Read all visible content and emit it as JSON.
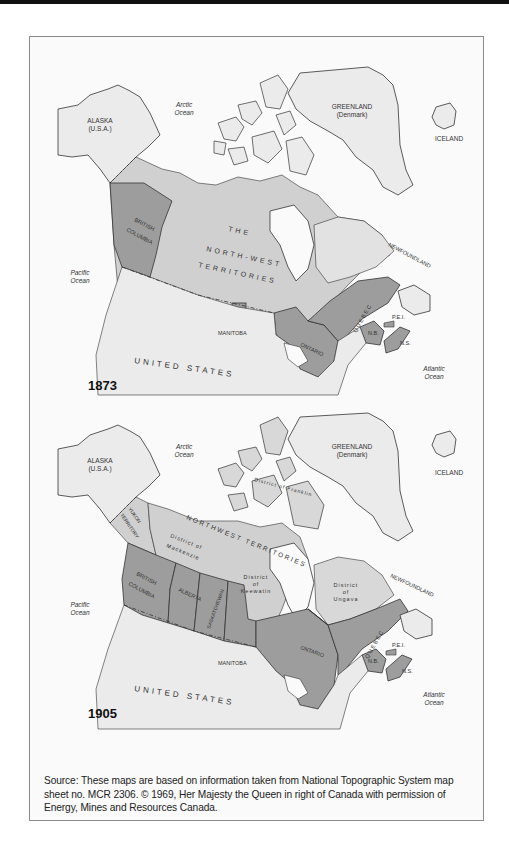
{
  "colors": {
    "land_light": "#ebebeb",
    "territory": "#cfcfcf",
    "province": "#9d9d9d",
    "ocean": "#fafafa",
    "outline": "#333333",
    "label": "#333333"
  },
  "maps": [
    {
      "year": "1873",
      "labels": {
        "alaska": "ALASKA",
        "alaska_sub": "(U.S.A.)",
        "arctic": "Arctic",
        "arctic2": "Ocean",
        "greenland": "GREENLAND",
        "greenland_sub": "(Denmark)",
        "iceland": "ICELAND",
        "pacific": "Pacific",
        "pacific2": "Ocean",
        "atlantic": "Atlantic",
        "atlantic2": "Ocean",
        "bc1": "BRITISH",
        "bc2": "COLUMBIA",
        "nwt1": "THE",
        "nwt2": "NORTH-WEST",
        "nwt3": "TERRITORIES",
        "manitoba": "MANITOBA",
        "ontario": "ONTARIO",
        "quebec": "QUEBEC",
        "newfoundland": "NEWFOUNDLAND",
        "pei": "P.E.I.",
        "nb": "N.B.",
        "ns": "N.S.",
        "us": "UNITED STATES"
      }
    },
    {
      "year": "1905",
      "labels": {
        "alaska": "ALASKA",
        "alaska_sub": "(U.S.A.)",
        "arctic": "Arctic",
        "arctic2": "Ocean",
        "greenland": "GREENLAND",
        "greenland_sub": "(Denmark)",
        "iceland": "ICELAND",
        "pacific": "Pacific",
        "pacific2": "Ocean",
        "atlantic": "Atlantic",
        "atlantic2": "Ocean",
        "yukon1": "YUKON",
        "yukon2": "TERRITORY",
        "bc1": "BRITISH",
        "bc2": "COLUMBIA",
        "alberta": "ALBERTA",
        "saskatchewan": "SASKATCHEWAN",
        "nwt": "NORTHWEST TERRITORIES",
        "franklin": "District of Franklin",
        "mackenzie1": "District of",
        "mackenzie2": "Mackenzie",
        "keewatin1": "District",
        "keewatin2": "of",
        "keewatin3": "Keewatin",
        "ungava1": "District",
        "ungava2": "of",
        "ungava3": "Ungava",
        "manitoba": "MANITOBA",
        "ontario": "ONTARIO",
        "quebec": "QUEBEC",
        "newfoundland": "NEWFOUNDLAND",
        "pei": "P.E.I.",
        "nb": "N.B.",
        "ns": "N.S.",
        "us": "UNITED STATES"
      }
    }
  ],
  "source": "Source: These maps are based on information taken from National Topographic System map sheet no. MCR 2306. © 1969, Her Majesty the Queen in right of Canada with permission of Energy, Mines and Resources Canada."
}
